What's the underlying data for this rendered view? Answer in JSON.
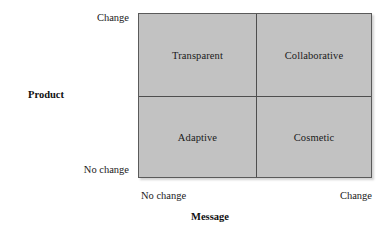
{
  "chart_data": {
    "type": "table",
    "title": "",
    "xlabel": "Message",
    "ylabel": "Product",
    "x_tick_labels": [
      "No change",
      "Change"
    ],
    "y_tick_labels": [
      "No change",
      "Change"
    ],
    "grid": false,
    "legend": "none",
    "colors": {
      "cell_fill": "#c2c2c2",
      "border": "#5a5a5a",
      "divider": "#4e4e4e",
      "text": "#1a1a1a",
      "background": "#ffffff"
    },
    "quadrants": [
      {
        "id": "top-left",
        "label": "Transparent",
        "x": "No change",
        "y": "Change"
      },
      {
        "id": "top-right",
        "label": "Collaborative",
        "x": "Change",
        "y": "Change"
      },
      {
        "id": "bottom-left",
        "label": "Adaptive",
        "x": "No change",
        "y": "No change"
      },
      {
        "id": "bottom-right",
        "label": "Cosmetic",
        "x": "Change",
        "y": "No change"
      }
    ]
  },
  "matrix": {
    "axes": {
      "vertical": {
        "title": "Product",
        "top_label": "Change",
        "bottom_label": "No change"
      },
      "horizontal": {
        "title": "Message",
        "left_label": "No change",
        "right_label": "Change"
      }
    },
    "cells": {
      "top_left": "Transparent",
      "top_right": "Collaborative",
      "bottom_left": "Adaptive",
      "bottom_right": "Cosmetic"
    }
  }
}
